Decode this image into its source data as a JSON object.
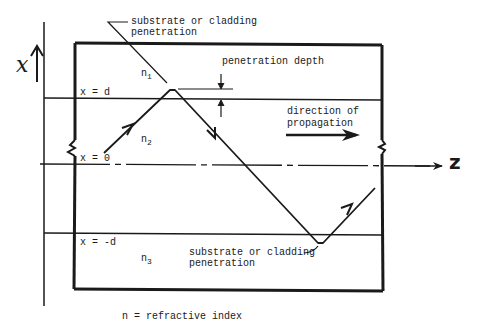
{
  "diagram": {
    "axes": {
      "vertical_label": "x",
      "horizontal_label": "z"
    },
    "boundaries": {
      "top": "x = d",
      "center": "x = 0",
      "bottom": "x = -d"
    },
    "regions": {
      "upper": {
        "label": "n",
        "subscript": "1"
      },
      "core": {
        "label": "n",
        "subscript": "2"
      },
      "lower": {
        "label": "n",
        "subscript": "3"
      }
    },
    "annotations": {
      "top_penetration_line1": "substrate or cladding",
      "top_penetration_line2": "penetration",
      "penetration_depth": "penetration depth",
      "direction_line1": "direction of",
      "direction_line2": "propagation",
      "bottom_penetration_line1": "substrate or cladding",
      "bottom_penetration_line2": "penetration"
    },
    "caption": "n = refractive index",
    "colors": {
      "ink": "#1a1a1a",
      "background": "#ffffff"
    }
  }
}
